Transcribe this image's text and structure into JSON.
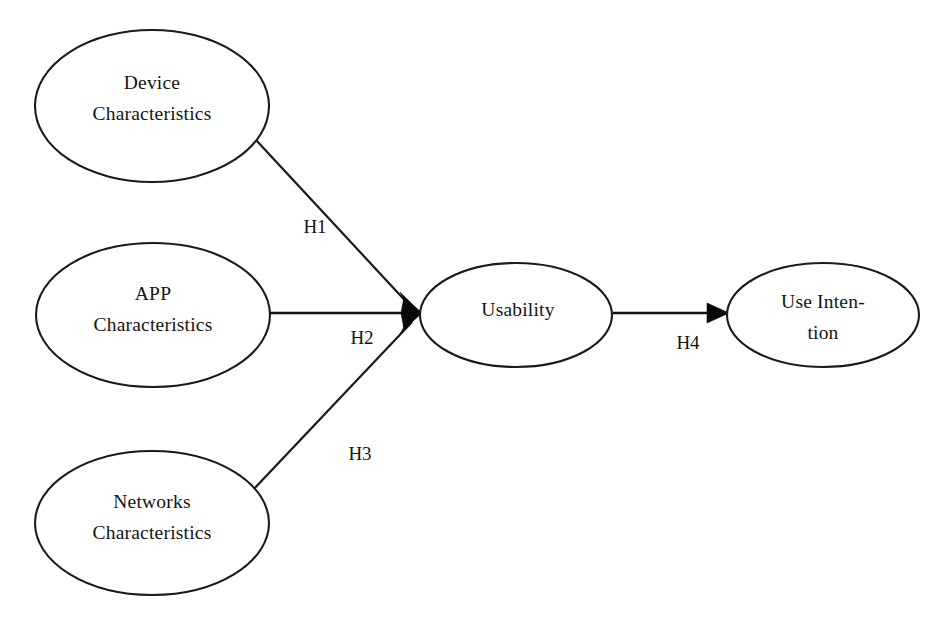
{
  "diagram": {
    "type": "conceptual-research-model",
    "background_color": "#ffffff",
    "line_color": "#111111",
    "text_color": "#141414",
    "nodes": [
      {
        "id": "device-characteristics",
        "line1": "Device",
        "line2": "Characteristics",
        "cx": 152,
        "cy": 106,
        "rx": 117,
        "ry": 76
      },
      {
        "id": "app-characteristics",
        "line1": "APP",
        "line2": "Characteristics",
        "cx": 153,
        "cy": 315,
        "rx": 117,
        "ry": 72
      },
      {
        "id": "networks-characteristics",
        "line1": "Networks",
        "line2": "Characteristics",
        "cx": 152,
        "cy": 523,
        "rx": 117,
        "ry": 72
      },
      {
        "id": "usability",
        "line1": "Usability",
        "line2": "",
        "cx": 516,
        "cy": 315,
        "rx": 96,
        "ry": 52
      },
      {
        "id": "use-intention",
        "line1": "Use Inten-",
        "line2": "tion",
        "cx": 823,
        "cy": 315,
        "rx": 96,
        "ry": 52
      }
    ],
    "edges": [
      {
        "id": "h1",
        "label": "H1",
        "from": "device-characteristics",
        "to": "usability",
        "label_x": 315,
        "label_y": 229
      },
      {
        "id": "h2",
        "label": "H2",
        "from": "app-characteristics",
        "to": "usability",
        "label_x": 362,
        "label_y": 340
      },
      {
        "id": "h3",
        "label": "H3",
        "from": "networks-characteristics",
        "to": "usability",
        "label_x": 360,
        "label_y": 456
      },
      {
        "id": "h4",
        "label": "H4",
        "from": "usability",
        "to": "use-intention",
        "label_x": 688,
        "label_y": 345
      }
    ]
  }
}
